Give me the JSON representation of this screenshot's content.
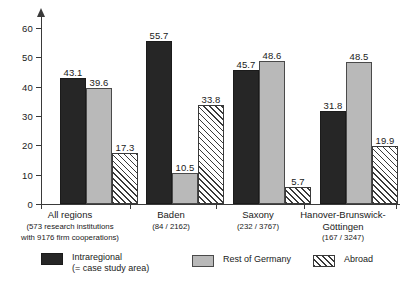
{
  "chart_data": {
    "type": "bar",
    "title": "",
    "subtitle": "",
    "xlabel": "",
    "ylabel": "",
    "ylim": [
      0,
      60
    ],
    "yticks": [
      0,
      10,
      20,
      30,
      40,
      50,
      60
    ],
    "grid": false,
    "legend_position": "bottom",
    "categories": [
      "All regions",
      "Baden",
      "Saxony",
      "Hanover-Brunswick-Göttingen"
    ],
    "category_sublabels": [
      "(573 research institutions\nwith 9176 firm cooperations)",
      "(84 / 2162)",
      "(232 / 3767)",
      "(167 / 3247)"
    ],
    "series": [
      {
        "name": "Intraregional",
        "name_line2": "(= case study area)",
        "color": "#262626",
        "pattern": "solid",
        "values": [
          43.1,
          55.7,
          45.7,
          31.8
        ]
      },
      {
        "name": "Rest of Germany",
        "name_line2": "",
        "color": "#b9b9b9",
        "pattern": "solid",
        "values": [
          39.6,
          10.5,
          48.6,
          48.5
        ]
      },
      {
        "name": "Abroad",
        "name_line2": "",
        "color": "#ffffff",
        "pattern": "diagonal-hatch",
        "values": [
          17.3,
          33.8,
          5.7,
          19.9
        ]
      }
    ]
  },
  "axis": {
    "tick_labels": [
      "0",
      "10",
      "20",
      "30",
      "40",
      "50",
      "60"
    ]
  },
  "categories_display": [
    {
      "name": "All regions",
      "sub1": "(573 research institutions",
      "sub2": "with 9176 firm cooperations)"
    },
    {
      "name": "Baden",
      "sub1": "(84 / 2162)",
      "sub2": ""
    },
    {
      "name": "Saxony",
      "sub1": "(232 / 3767)",
      "sub2": ""
    },
    {
      "name": "Hanover-Brunswick-",
      "sub1": "Göttingen",
      "sub2": "(167 / 3247)"
    }
  ],
  "values_display": {
    "g0": [
      "43.1",
      "39.6",
      "17.3"
    ],
    "g1": [
      "55.7",
      "10.5",
      "33.8"
    ],
    "g2": [
      "45.7",
      "48.6",
      "5.7"
    ],
    "g3": [
      "31.8",
      "48.5",
      "19.9"
    ]
  },
  "legend": {
    "items": [
      {
        "label": "Intraregional",
        "label2": "(= case study area)"
      },
      {
        "label": "Rest of Germany",
        "label2": ""
      },
      {
        "label": "Abroad",
        "label2": ""
      }
    ]
  }
}
